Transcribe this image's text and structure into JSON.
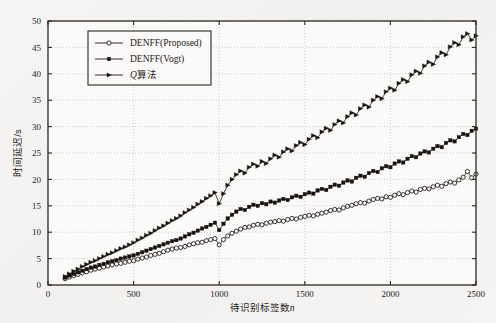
{
  "figure": {
    "background_color": "#f4f3f1",
    "plot_background_color": "#fbfaf9",
    "axis_color": "#2a2724",
    "grid_color": "#b9b5b0",
    "series_color": "#161310"
  },
  "chart_data": {
    "type": "line",
    "title": "",
    "xlabel_cn": "待识别标签数",
    "xlabel_italic": "n",
    "ylabel": "时间延迟/s",
    "xlim": [
      0,
      2500
    ],
    "ylim": [
      0,
      50
    ],
    "xticks": [
      0,
      500,
      1000,
      1500,
      2000,
      2500
    ],
    "yticks": [
      0,
      5,
      10,
      15,
      20,
      25,
      30,
      35,
      40,
      45,
      50
    ],
    "grid": true,
    "grid_style": "dotted",
    "legend_position": "upper-left",
    "series": [
      {
        "name": "DENFF(Proposed)",
        "marker": "open-circle",
        "x": [
          100,
          125,
          150,
          175,
          200,
          225,
          250,
          275,
          300,
          325,
          350,
          375,
          400,
          425,
          450,
          475,
          500,
          525,
          550,
          575,
          600,
          625,
          650,
          675,
          700,
          725,
          750,
          775,
          800,
          825,
          850,
          875,
          900,
          925,
          950,
          975,
          1000,
          1025,
          1050,
          1075,
          1100,
          1125,
          1150,
          1175,
          1200,
          1225,
          1250,
          1275,
          1300,
          1325,
          1350,
          1375,
          1400,
          1425,
          1450,
          1475,
          1500,
          1525,
          1550,
          1575,
          1600,
          1625,
          1650,
          1675,
          1700,
          1725,
          1750,
          1775,
          1800,
          1825,
          1850,
          1875,
          1900,
          1925,
          1950,
          1975,
          2000,
          2025,
          2050,
          2075,
          2100,
          2125,
          2150,
          2175,
          2200,
          2225,
          2250,
          2275,
          2300,
          2325,
          2350,
          2375,
          2400,
          2425,
          2450,
          2475,
          2500
        ],
        "y": [
          1.2,
          1.5,
          1.8,
          2.0,
          2.3,
          2.5,
          2.8,
          3.0,
          3.2,
          3.4,
          3.6,
          3.8,
          4.0,
          4.1,
          4.3,
          4.5,
          4.6,
          4.9,
          5.1,
          5.3,
          5.6,
          5.8,
          6.0,
          6.3,
          6.6,
          6.8,
          7.0,
          7.1,
          7.3,
          7.6,
          7.8,
          8.0,
          8.1,
          8.4,
          8.6,
          8.8,
          7.6,
          8.6,
          9.3,
          9.8,
          10.2,
          10.6,
          10.9,
          11.0,
          11.3,
          11.5,
          11.4,
          11.7,
          11.9,
          12.0,
          12.2,
          12.1,
          12.4,
          12.6,
          12.5,
          12.8,
          13.0,
          13.2,
          13.1,
          13.4,
          13.6,
          13.8,
          14.1,
          14.3,
          14.2,
          14.6,
          14.9,
          15.1,
          15.4,
          15.6,
          15.5,
          15.9,
          16.2,
          16.4,
          16.3,
          16.7,
          16.6,
          17.0,
          17.3,
          17.1,
          17.5,
          17.8,
          17.6,
          18.1,
          18.3,
          18.2,
          18.6,
          18.9,
          18.7,
          19.2,
          19.5,
          19.3,
          19.9,
          20.4,
          21.5,
          20.3,
          21.0
        ]
      },
      {
        "name": "DENFF(Vogt)",
        "marker": "filled-square",
        "x": [
          100,
          125,
          150,
          175,
          200,
          225,
          250,
          275,
          300,
          325,
          350,
          375,
          400,
          425,
          450,
          475,
          500,
          525,
          550,
          575,
          600,
          625,
          650,
          675,
          700,
          725,
          750,
          775,
          800,
          825,
          850,
          875,
          900,
          925,
          950,
          975,
          1000,
          1025,
          1050,
          1075,
          1100,
          1125,
          1150,
          1175,
          1200,
          1225,
          1250,
          1275,
          1300,
          1325,
          1350,
          1375,
          1400,
          1425,
          1450,
          1475,
          1500,
          1525,
          1550,
          1575,
          1600,
          1625,
          1650,
          1675,
          1700,
          1725,
          1750,
          1775,
          1800,
          1825,
          1850,
          1875,
          1900,
          1925,
          1950,
          1975,
          2000,
          2025,
          2050,
          2075,
          2100,
          2125,
          2150,
          2175,
          2200,
          2225,
          2250,
          2275,
          2300,
          2325,
          2350,
          2375,
          2400,
          2425,
          2450,
          2475,
          2500
        ],
        "y": [
          1.4,
          1.8,
          2.1,
          2.4,
          2.7,
          3.0,
          3.3,
          3.5,
          3.8,
          4.0,
          4.3,
          4.5,
          4.7,
          5.0,
          5.2,
          5.4,
          5.6,
          5.9,
          6.2,
          6.5,
          6.8,
          7.1,
          7.4,
          7.7,
          8.0,
          8.3,
          8.5,
          8.8,
          9.2,
          9.6,
          9.9,
          10.3,
          10.7,
          11.0,
          11.4,
          11.8,
          10.4,
          11.6,
          12.6,
          13.3,
          13.9,
          14.4,
          14.2,
          14.8,
          15.2,
          15.0,
          15.5,
          15.3,
          15.8,
          15.6,
          16.0,
          16.3,
          16.1,
          16.6,
          16.9,
          16.7,
          17.2,
          17.5,
          17.3,
          17.9,
          18.2,
          18.0,
          18.6,
          19.0,
          18.8,
          19.4,
          19.8,
          19.6,
          20.3,
          20.7,
          20.5,
          21.2,
          21.6,
          21.4,
          22.1,
          22.5,
          22.3,
          23.0,
          23.4,
          23.2,
          23.9,
          24.4,
          24.2,
          24.9,
          25.3,
          25.1,
          25.8,
          26.3,
          26.1,
          26.9,
          27.4,
          27.2,
          28.0,
          28.6,
          28.4,
          29.2,
          29.6
        ]
      },
      {
        "name": "Q算法",
        "marker": "filled-triangle-right",
        "x": [
          100,
          125,
          150,
          175,
          200,
          225,
          250,
          275,
          300,
          325,
          350,
          375,
          400,
          425,
          450,
          475,
          500,
          525,
          550,
          575,
          600,
          625,
          650,
          675,
          700,
          725,
          750,
          775,
          800,
          825,
          850,
          875,
          900,
          925,
          950,
          975,
          1000,
          1025,
          1050,
          1075,
          1100,
          1125,
          1150,
          1175,
          1200,
          1225,
          1250,
          1275,
          1300,
          1325,
          1350,
          1375,
          1400,
          1425,
          1450,
          1475,
          1500,
          1525,
          1550,
          1575,
          1600,
          1625,
          1650,
          1675,
          1700,
          1725,
          1750,
          1775,
          1800,
          1825,
          1850,
          1875,
          1900,
          1925,
          1950,
          1975,
          2000,
          2025,
          2050,
          2075,
          2100,
          2125,
          2150,
          2175,
          2200,
          2225,
          2250,
          2275,
          2300,
          2325,
          2350,
          2375,
          2400,
          2425,
          2450,
          2475,
          2500
        ],
        "y": [
          1.6,
          2.1,
          2.6,
          3.0,
          3.5,
          3.9,
          4.3,
          4.6,
          5.0,
          5.4,
          5.8,
          6.1,
          6.5,
          6.9,
          7.2,
          7.6,
          8.0,
          8.5,
          8.9,
          9.4,
          9.8,
          10.3,
          10.8,
          11.2,
          11.7,
          12.2,
          12.6,
          13.1,
          13.7,
          14.2,
          14.7,
          15.3,
          15.8,
          16.4,
          16.9,
          17.5,
          15.4,
          17.3,
          18.9,
          20.0,
          20.9,
          21.6,
          21.2,
          22.3,
          22.9,
          22.5,
          23.4,
          23.0,
          23.9,
          24.6,
          24.2,
          25.2,
          25.8,
          25.4,
          26.4,
          27.0,
          26.6,
          27.6,
          28.3,
          27.9,
          29.0,
          29.7,
          29.3,
          30.4,
          31.1,
          30.7,
          31.9,
          32.6,
          32.2,
          33.4,
          34.1,
          33.7,
          35.0,
          35.7,
          35.3,
          36.6,
          37.3,
          36.9,
          38.2,
          38.9,
          38.5,
          39.8,
          40.5,
          40.1,
          41.5,
          42.2,
          41.8,
          43.2,
          44.0,
          43.6,
          45.1,
          45.9,
          45.5,
          47.0,
          47.6,
          46.4,
          47.2
        ]
      }
    ]
  },
  "legend": {
    "items": [
      {
        "label": "DENFF(Proposed)",
        "marker": "open-circle"
      },
      {
        "label": "DENFF(Vogt)",
        "marker": "filled-square"
      },
      {
        "label_prefix": "Q",
        "label_suffix": "算法",
        "marker": "filled-triangle-right"
      }
    ]
  }
}
